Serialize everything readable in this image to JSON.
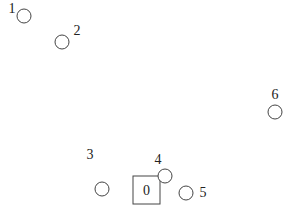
{
  "diagram": {
    "type": "node-placement",
    "depot": {
      "id": "0",
      "label": "0",
      "x": 146.5,
      "y": 190,
      "width": 27,
      "height": 28
    },
    "nodes": [
      {
        "id": "1",
        "label": "1",
        "cx": 24,
        "cy": 16,
        "r": 7,
        "label_x": 12,
        "label_y": 13
      },
      {
        "id": "2",
        "label": "2",
        "cx": 62,
        "cy": 42,
        "r": 7,
        "label_x": 77,
        "label_y": 35
      },
      {
        "id": "3",
        "label": "3",
        "cx": 102,
        "cy": 189,
        "r": 7,
        "label_x": 90,
        "label_y": 159
      },
      {
        "id": "4",
        "label": "4",
        "cx": 165,
        "cy": 176,
        "r": 7,
        "label_x": 158,
        "label_y": 164
      },
      {
        "id": "5",
        "label": "5",
        "cx": 186,
        "cy": 193,
        "r": 7,
        "label_x": 203,
        "label_y": 197
      },
      {
        "id": "6",
        "label": "6",
        "cx": 275,
        "cy": 112,
        "r": 7,
        "label_x": 275,
        "label_y": 99
      }
    ],
    "colors": {
      "stroke": "#444444",
      "text": "#222222",
      "background": "#ffffff"
    }
  }
}
